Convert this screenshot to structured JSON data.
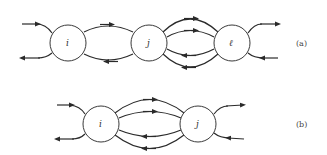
{
  "diagram_a": {
    "label": "(a)",
    "nodes": [
      {
        "id": "i",
        "label": "i"
      },
      {
        "id": "j",
        "label": "j"
      },
      {
        "id": "l",
        "label": "ℓ"
      }
    ],
    "edges": [
      {
        "from": "external",
        "to": "i",
        "direction": "in"
      },
      {
        "from": "i",
        "to": "external",
        "direction": "out"
      },
      {
        "from": "i",
        "to": "j",
        "count": 1
      },
      {
        "from": "j",
        "to": "i",
        "count": 1
      },
      {
        "from": "j",
        "to": "l",
        "count": 2
      },
      {
        "from": "l",
        "to": "j",
        "count": 2
      },
      {
        "from": "l",
        "to": "external",
        "direction": "out"
      },
      {
        "from": "external",
        "to": "l",
        "direction": "in"
      }
    ]
  },
  "diagram_b": {
    "label": "(b)",
    "nodes": [
      {
        "id": "i",
        "label": "i"
      },
      {
        "id": "j",
        "label": "j"
      }
    ],
    "edges": [
      {
        "from": "external",
        "to": "i",
        "direction": "in"
      },
      {
        "from": "i",
        "to": "external",
        "direction": "out"
      },
      {
        "from": "i",
        "to": "j",
        "count": 2
      },
      {
        "from": "j",
        "to": "i",
        "count": 2
      },
      {
        "from": "j",
        "to": "external",
        "direction": "out"
      },
      {
        "from": "external",
        "to": "j",
        "direction": "in"
      }
    ]
  }
}
